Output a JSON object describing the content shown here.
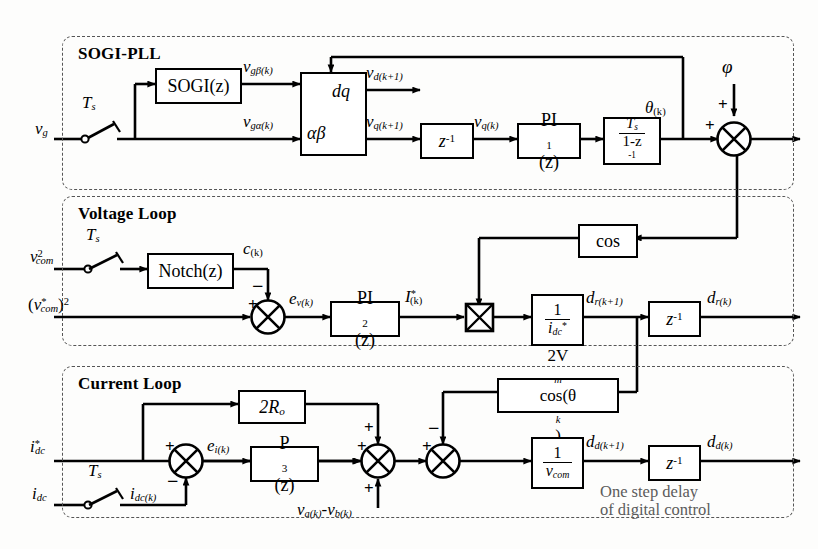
{
  "figure": {
    "kind": "control-block-diagram"
  },
  "groups": [
    {
      "id": "sogi_pll",
      "title": "SOGI-PLL"
    },
    {
      "id": "voltage_loop",
      "title": "Voltage Loop"
    },
    {
      "id": "current_loop",
      "title": "Current Loop"
    }
  ],
  "sogi_pll": {
    "title": "SOGI-PLL",
    "input_label": "v",
    "input_sub": "g",
    "sampler_label": "T",
    "sampler_sub": "s",
    "blocks": {
      "sogi": "SOGI(z)",
      "transform_top": "dq",
      "transform_bottom": "αβ",
      "delay": "z",
      "delay_sup": "-1",
      "pi1": "PI",
      "pi1_sub": "1",
      "pi1_tail": "(z)",
      "integrator_num": "T",
      "integrator_num_sub": "s",
      "integrator_den": "1-z",
      "integrator_den_sup": "-1"
    },
    "signals": {
      "v_gbeta": "v",
      "v_gbeta_sub": "gβ(k)",
      "v_galpha": "v",
      "v_galpha_sub": "gα(k)",
      "v_d": "v",
      "v_d_sub": "d(k+1)",
      "v_q_kp1": "v",
      "v_q_kp1_sub": "q(k+1)",
      "v_q_k": "v",
      "v_q_k_sub": "q(k)",
      "theta": "θ",
      "theta_sub": "(k)",
      "phi": "φ"
    },
    "sum_signs": {
      "phi_in": "+",
      "theta_in": "+"
    }
  },
  "voltage_loop": {
    "title": "Voltage Loop",
    "input_label": "v",
    "input_sub": "com",
    "input_sup": "2",
    "sampler_label": "T",
    "sampler_sub": "s",
    "reference_label": "(v*com)²",
    "reference_parts": {
      "open": "(",
      "v": "v",
      "sub": "com",
      "star": "*",
      "close": ")",
      "pow": "2"
    },
    "blocks": {
      "notch": "Notch(z)",
      "pi2": "PI",
      "pi2_sub": "2",
      "pi2_tail": "(z)",
      "cos": "cos",
      "gain_num": "1",
      "gain_den": "i",
      "gain_den_sub": "dc",
      "gain_den_star": "*",
      "delay": "z",
      "delay_sup": "-1"
    },
    "signals": {
      "c_k": "c",
      "c_k_sub": "(k)",
      "e_v": "e",
      "e_v_sub": "v(k)",
      "I_star": "I",
      "I_star_sup": "*",
      "I_star_sub": "(k)",
      "d_r_kp1": "d",
      "d_r_kp1_sub": "r(k+1)",
      "d_r_k": "d",
      "d_r_k_sub": "r(k)"
    },
    "sum_signs": {
      "reference_in": "+",
      "notch_in": "−"
    }
  },
  "current_loop": {
    "title": "Current Loop",
    "reference_label": "i",
    "reference_sub": "dc",
    "reference_sup": "*",
    "feedback_label": "i",
    "feedback_sub": "dc",
    "sampler_label": "T",
    "sampler_sub": "s",
    "sampled_label": "i",
    "sampled_sub": "dc(k)",
    "blocks": {
      "gain_2Ro": "2R",
      "gain_2Ro_sub": "o",
      "p3": "P",
      "p3_sub": "3",
      "p3_tail": "(z)",
      "vm_cos": "2V",
      "vm_cos_sub": "m",
      "vm_cos_tail": "cos(θ",
      "vm_cos_tail_sub": "k",
      "vm_cos_close": ")",
      "gain_num": "1",
      "gain_den": "v",
      "gain_den_sub": "com",
      "delay": "z",
      "delay_sup": "-1"
    },
    "signals": {
      "e_i": "e",
      "e_i_sub": "i(k)",
      "vab": "v",
      "vab_sub_a": "a(k)",
      "vab_minus": "-",
      "vab_v2": "v",
      "vab_sub_b": "b(k)",
      "d_d_kp1": "d",
      "d_d_kp1_sub": "d(k+1)",
      "d_d_k": "d",
      "d_d_k_sub": "d(k)"
    },
    "sum1_signs": {
      "ref_in": "+",
      "fb_in": "−"
    },
    "sum2_signs": {
      "p3_in": "+",
      "top_in": "+",
      "bottom_in": "+"
    },
    "sum3_signs": {
      "left_in": "+",
      "top_in": "−"
    },
    "annotation_line1": "One step delay",
    "annotation_line2": "of digital control"
  },
  "colors": {
    "line": "#000000",
    "group_border": "#555555",
    "background": "#fdfdfc",
    "annotation": "#5b5b5b"
  }
}
